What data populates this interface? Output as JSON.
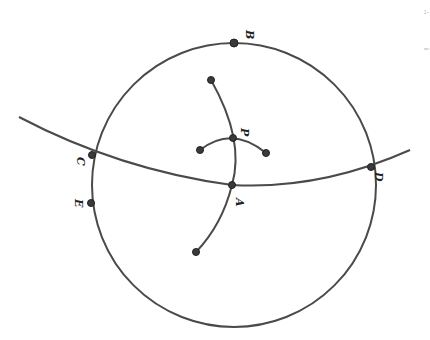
{
  "diagram": {
    "type": "geometric construction (rotated)",
    "circle": {
      "cx": 234,
      "cy": 185,
      "r": 142
    },
    "points": [
      {
        "id": "A",
        "label": "A",
        "x": 232,
        "y": 185,
        "lx": 236,
        "ly": 203
      },
      {
        "id": "B",
        "label": "B",
        "x": 234,
        "y": 43,
        "lx": 248,
        "ly": 34
      },
      {
        "id": "C",
        "label": "C",
        "x": 92,
        "y": 155,
        "lx": 80,
        "ly": 162
      },
      {
        "id": "D",
        "label": "D",
        "x": 371,
        "y": 167,
        "lx": 378,
        "ly": 176
      },
      {
        "id": "E",
        "label": "E",
        "x": 91,
        "y": 203,
        "lx": 78,
        "ly": 206
      },
      {
        "id": "P",
        "label": "P",
        "x": 233,
        "y": 138,
        "lx": 244,
        "ly": 130
      }
    ],
    "endpoints": [
      {
        "id": "top-arc-end",
        "x": 211,
        "y": 80
      },
      {
        "id": "bottom-arc-end",
        "x": 196,
        "y": 252
      },
      {
        "id": "left-small-arc-end",
        "x": 200,
        "y": 150
      },
      {
        "id": "right-small-arc-end",
        "x": 266,
        "y": 153
      }
    ],
    "edge_marks": [
      "∴",
      "i"
    ]
  }
}
